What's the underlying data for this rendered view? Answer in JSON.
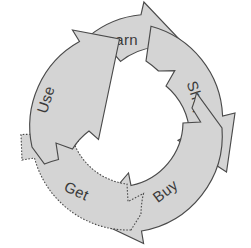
{
  "diagram": {
    "type": "cycle",
    "direction": "clockwise",
    "background_color": "#ffffff",
    "segment_fill": "#d4d4d4",
    "segment_stroke": "#4a4a4a",
    "label_color": "#3a3a3a",
    "center_fill": "#ffffff",
    "segments": [
      {
        "id": "learn",
        "label": "Learn",
        "order": 1,
        "position": "top",
        "rotation_deg": 0,
        "outline_style": "solid",
        "label_x": 118,
        "label_y": 41
      },
      {
        "id": "shop",
        "label": "Shop",
        "order": 2,
        "position": "right",
        "rotation_deg": 72,
        "outline_style": "solid",
        "label_x": 196,
        "label_y": 99
      },
      {
        "id": "buy",
        "label": "Buy",
        "order": 3,
        "position": "bottom-right",
        "rotation_deg": 144,
        "outline_style": "solid",
        "label_x": 166,
        "label_y": 192
      },
      {
        "id": "get",
        "label": "Get",
        "order": 4,
        "position": "bottom-left",
        "rotation_deg": 216,
        "outline_style": "dotted",
        "label_x": 76,
        "label_y": 192
      },
      {
        "id": "use",
        "label": "Use",
        "order": 5,
        "position": "left",
        "rotation_deg": 288,
        "outline_style": "solid",
        "label_x": 47,
        "label_y": 100
      }
    ]
  }
}
